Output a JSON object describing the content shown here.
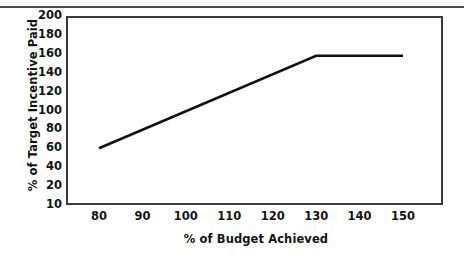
{
  "figure": {
    "background_color": "#ffffff",
    "line_color": "#111111",
    "axis_color": "#3b3b3b"
  },
  "chart_data": {
    "type": "line",
    "title": "",
    "xlabel": "% of Budget Achieved",
    "ylabel": "% of Target Incentive Paid",
    "xlim": [
      75,
      155
    ],
    "ylim": [
      10,
      200
    ],
    "grid": false,
    "legend": false,
    "xticks": [
      "80",
      "90",
      "100",
      "110",
      "120",
      "130",
      "140",
      "150"
    ],
    "xtick_values": [
      80,
      90,
      100,
      110,
      120,
      130,
      140,
      150
    ],
    "yticks": [
      "200",
      "180",
      "160",
      "140",
      "120",
      "100",
      "80",
      "60",
      "40",
      "20",
      "10"
    ],
    "ytick_values": [
      200,
      180,
      160,
      140,
      120,
      100,
      80,
      60,
      40,
      20,
      10
    ],
    "series": [
      {
        "name": "Incentive payout curve",
        "x": [
          80,
          130,
          150
        ],
        "values": [
          60,
          158,
          158
        ]
      }
    ],
    "annotations": []
  }
}
